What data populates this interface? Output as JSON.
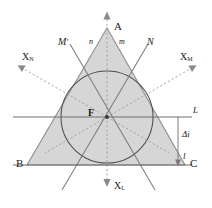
{
  "figure": {
    "type": "geometric-diagram",
    "title": "",
    "colors": {
      "triangle_fill": "#d6d6d6",
      "triangle_stroke": "#8a8a8a",
      "circle_stroke": "#4d4d4d",
      "solid_line": "#7a7a7a",
      "dashed_line": "#9a9a9a",
      "axis_line": "#6f6f6f",
      "text": "#1a1a1a",
      "background": "#ffffff"
    },
    "vertices": {
      "A": {
        "label": "A",
        "x": 107,
        "y": 28
      },
      "B": {
        "label": "B",
        "x": 27,
        "y": 165
      },
      "C": {
        "label": "C",
        "x": 185,
        "y": 165
      }
    },
    "center": {
      "label": "F",
      "x": 107,
      "y": 117
    },
    "incircle": {
      "cx": 107,
      "cy": 117,
      "r": 46
    },
    "labels": {
      "apex": "A",
      "bottom_left": "B",
      "bottom_right": "C",
      "center": "F",
      "line_n": "n",
      "line_m": "m",
      "line_M_prime": "M",
      "line_M_prime_mark": "′",
      "line_N": "N",
      "axis_L_top": "L",
      "axis_l_bottom": "l",
      "delta_i": "Δi",
      "axis_XN": "X",
      "axis_XN_sub": "N",
      "axis_XM": "X",
      "axis_XM_sub": "M",
      "axis_XL": "X",
      "axis_XL_sub": "L"
    }
  }
}
